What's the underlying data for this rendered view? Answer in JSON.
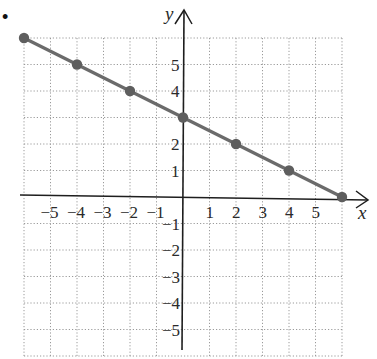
{
  "problem": {
    "bullet": "•"
  },
  "chart_data": {
    "type": "line",
    "title": "",
    "xlabel": "x",
    "ylabel": "y",
    "xlim": [
      -6,
      6
    ],
    "ylim": [
      -6,
      6
    ],
    "grid": true,
    "grid_style": "dotted",
    "x_tick_labels": [
      "−5",
      "−4",
      "−3",
      "−2",
      "−1",
      "1",
      "2",
      "3",
      "4",
      "5"
    ],
    "x_ticks": [
      -5,
      -4,
      -3,
      -2,
      -1,
      1,
      2,
      3,
      4,
      5
    ],
    "y_tick_labels": [
      "5",
      "4",
      "2",
      "1",
      "−1",
      "−2",
      "−3",
      "−4",
      "−5"
    ],
    "y_ticks": [
      5,
      4,
      2,
      1,
      -1,
      -2,
      -3,
      -4,
      -5
    ],
    "series": [
      {
        "name": "line",
        "equation": "y = -x/2 + 3",
        "x": [
          -6,
          -4,
          -2,
          0,
          2,
          4,
          6
        ],
        "y": [
          6,
          5,
          4,
          3,
          2,
          1,
          0
        ],
        "color": "#6b6b6b",
        "markers": true
      }
    ],
    "legend": null
  },
  "colors": {
    "axis": "#1e1e1e",
    "grid": "#9a9a9a",
    "line": "#6b6b6b",
    "marker": "#5e5e5e"
  }
}
